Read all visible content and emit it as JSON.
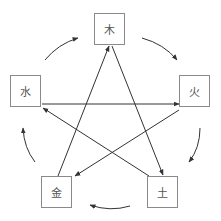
{
  "colors": {
    "line": "#333333",
    "box_border": "#8a8a8a",
    "text": "#555555",
    "background": "#ffffff"
  },
  "nodes": [
    {
      "id": "wood",
      "label": "木",
      "x": 94,
      "y": 13
    },
    {
      "id": "fire",
      "label": "火",
      "x": 179,
      "y": 75
    },
    {
      "id": "earth",
      "label": "土",
      "x": 147,
      "y": 176
    },
    {
      "id": "metal",
      "label": "金",
      "x": 41,
      "y": 176
    },
    {
      "id": "water",
      "label": "水",
      "x": 10,
      "y": 75
    }
  ],
  "generating_cycle": [
    {
      "from": "木",
      "to": "火"
    },
    {
      "from": "火",
      "to": "土"
    },
    {
      "from": "土",
      "to": "金"
    },
    {
      "from": "金",
      "to": "水"
    },
    {
      "from": "水",
      "to": "木"
    }
  ],
  "overcoming_cycle": [
    {
      "from": "水",
      "to": "火"
    },
    {
      "from": "火",
      "to": "金"
    },
    {
      "from": "金",
      "to": "木"
    },
    {
      "from": "木",
      "to": "土"
    },
    {
      "from": "土",
      "to": "水"
    }
  ]
}
